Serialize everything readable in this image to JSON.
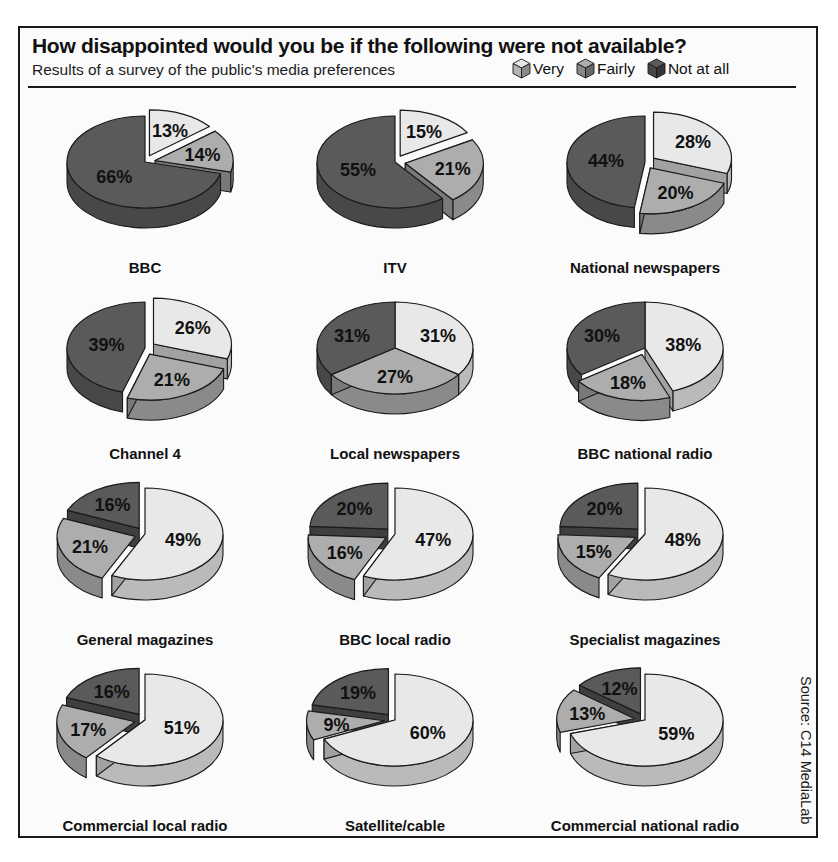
{
  "header": {
    "title": "How disappointed would you be if the following were not available?",
    "subtitle": "Results of a survey of the public's media preferences"
  },
  "legend": {
    "items": [
      {
        "label": "Very",
        "icon": "cube-icon",
        "color": "#e6e6e6"
      },
      {
        "label": "Fairly",
        "icon": "cube-icon",
        "color": "#adadad"
      },
      {
        "label": "Not at all",
        "icon": "cube-icon",
        "color": "#5a5a5a"
      }
    ]
  },
  "source": "Source: C14 MediaLab",
  "colors": {
    "very": "#e8e8e8",
    "fairly": "#adadad",
    "not_at_all": "#5a5a5a",
    "outline": "#1a1a1a",
    "frame": "#1a1a1a",
    "background": "#fbfbfb"
  },
  "chart_data": {
    "type": "pie",
    "title": "How disappointed would you be if the following were not available?",
    "subtitle": "Results of a survey of the public's media preferences",
    "source": "Source: C14 MediaLab",
    "units": "percent",
    "legend_position": "top-right",
    "categories": [
      "Very",
      "Fairly",
      "Not at all"
    ],
    "charts": [
      {
        "name": "BBC",
        "labels": [
          "13%",
          "14%",
          "66%"
        ],
        "values": [
          13,
          14,
          66
        ],
        "exploded": [
          "Very",
          "Fairly"
        ]
      },
      {
        "name": "ITV",
        "labels": [
          "15%",
          "21%",
          "55%"
        ],
        "values": [
          15,
          21,
          55
        ],
        "exploded": [
          "Very",
          "Fairly"
        ]
      },
      {
        "name": "National newspapers",
        "labels": [
          "28%",
          "20%",
          "44%"
        ],
        "values": [
          28,
          20,
          44
        ],
        "exploded": [
          "Very",
          "Fairly"
        ]
      },
      {
        "name": "Channel 4",
        "labels": [
          "26%",
          "21%",
          "39%"
        ],
        "values": [
          26,
          21,
          39
        ],
        "exploded": [
          "Very",
          "Fairly"
        ]
      },
      {
        "name": "Local newspapers",
        "labels": [
          "31%",
          "27%",
          "31%"
        ],
        "values": [
          31,
          27,
          31
        ],
        "exploded": []
      },
      {
        "name": "BBC national radio",
        "labels": [
          "38%",
          "18%",
          "30%"
        ],
        "values": [
          38,
          18,
          30
        ],
        "exploded": [
          "Fairly"
        ]
      },
      {
        "name": "General magazines",
        "labels": [
          "49%",
          "21%",
          "16%"
        ],
        "values": [
          49,
          21,
          16
        ],
        "exploded": [
          "Fairly",
          "Not at all"
        ]
      },
      {
        "name": "BBC local radio",
        "labels": [
          "47%",
          "16%",
          "20%"
        ],
        "values": [
          47,
          16,
          20
        ],
        "exploded": [
          "Fairly",
          "Not at all"
        ]
      },
      {
        "name": "Specialist magazines",
        "labels": [
          "48%",
          "15%",
          "20%"
        ],
        "values": [
          48,
          15,
          20
        ],
        "exploded": [
          "Fairly",
          "Not at all"
        ]
      },
      {
        "name": "Commercial local radio",
        "labels": [
          "51%",
          "17%",
          "16%"
        ],
        "values": [
          51,
          17,
          16
        ],
        "exploded": [
          "Fairly",
          "Not at all"
        ]
      },
      {
        "name": "Satellite/cable",
        "labels": [
          "60%",
          "9%",
          "19%"
        ],
        "values": [
          60,
          9,
          19
        ],
        "exploded": [
          "Fairly",
          "Not at all"
        ]
      },
      {
        "name": "Commercial national radio",
        "labels": [
          "59%",
          "13%",
          "12%"
        ],
        "values": [
          59,
          13,
          12
        ],
        "exploded": [
          "Fairly",
          "Not at all"
        ]
      }
    ],
    "grid": {
      "rows": 4,
      "cols": 3
    }
  }
}
